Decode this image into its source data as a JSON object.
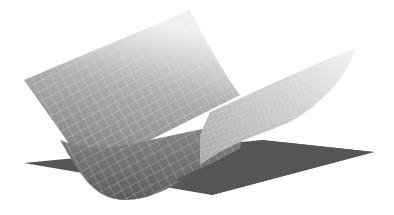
{
  "figure": {
    "labels": []
  },
  "colors": {
    "background": "#ffffff",
    "plane": "#555555",
    "surface_dark": "#7a7a7a",
    "surface_light": "#e8e8e8",
    "grid_lines": "#dcdcdc"
  }
}
